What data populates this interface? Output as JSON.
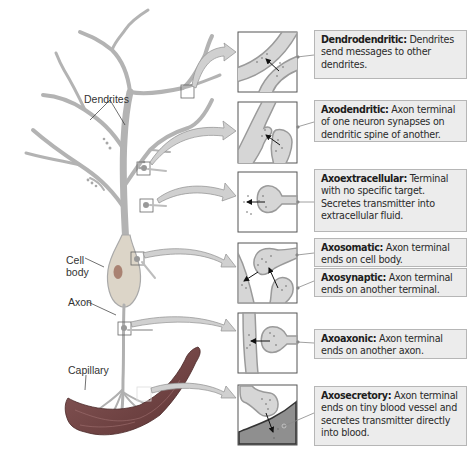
{
  "figure": {
    "neuron_labels": {
      "dendrites": "Dendrites",
      "cell_body_line1": "Cell",
      "cell_body_line2": "body",
      "axon": "Axon",
      "capillary": "Capillary"
    },
    "synapse_types": [
      {
        "name": "Dendrodendritic:",
        "description": " Dendrites send messages to other dendrites.",
        "icon": "dendrodendritic-inset"
      },
      {
        "name": "Axodendritic:",
        "description": " Axon terminal of one neuron synapses on dendritic spine of another.",
        "icon": "axodendritic-inset"
      },
      {
        "name": "Axoextracellular:",
        "description": " Terminal with no specific target. Secretes transmitter into extracellular fluid.",
        "icon": "axoextracellular-inset"
      },
      {
        "name": "Axosomatic:",
        "description": " Axon terminal ends on cell body.",
        "icon": "axosomatic-inset"
      },
      {
        "name": "Axosynaptic:",
        "description": " Axon terminal ends on another terminal.",
        "icon": "axosynaptic-inset"
      },
      {
        "name": "Axoaxonic:",
        "description": " Axon terminal ends on another axon.",
        "icon": "axoaxonic-inset"
      },
      {
        "name": "Axosecretory:",
        "description": " Axon terminal ends on tiny blood vessel and secretes transmitter directly into blood.",
        "icon": "axosecretory-inset"
      }
    ],
    "colors": {
      "neuron_fill": "#b9b9b9",
      "neuron_stroke": "#9a9a9a",
      "cell_body_fill": "#d9d2c4",
      "nucleus": "#a37d6c",
      "capillary": "#7a4a4a",
      "box_fill": "#ececec",
      "box_border": "#b6b6b6",
      "panel_cell": "#d6d6d6",
      "panel_blood": "#8f8f8f"
    }
  }
}
